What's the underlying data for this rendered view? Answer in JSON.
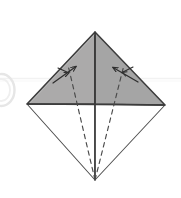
{
  "figure": {
    "type": "diagram",
    "caption": "",
    "canvas": {
      "width": 181,
      "height": 198
    },
    "background_color": "#ffffff"
  },
  "colors": {
    "shaded_fill": "#a8a8a8",
    "shaded_fill_light": "#b0b0b0",
    "outline_stroke": "#3c3c3c",
    "thin_stroke": "#555555",
    "dashed_stroke": "#4a4a4a",
    "arrow_stroke": "#333333",
    "faint_guide": "#f0f0f0",
    "faint_arc": "#e8e8e8",
    "white_fill": "#ffffff"
  },
  "geometry": {
    "top_vertex": {
      "x": 95,
      "y": 32
    },
    "left_vertex": {
      "x": 27,
      "y": 104
    },
    "right_vertex": {
      "x": 165,
      "y": 105
    },
    "bottom_vertex": {
      "x": 95,
      "y": 180
    },
    "center": {
      "x": 95,
      "y": 104
    }
  },
  "shapes": [
    {
      "name": "upper-left-shaded-triangle",
      "kind": "polygon",
      "points": "95,32 27,104 95,104",
      "fill": "#a9a9a9",
      "stroke": "#3c3c3c"
    },
    {
      "name": "upper-right-shaded-triangle",
      "kind": "polygon",
      "points": "95,32 165,105 95,104",
      "fill": "#a3a3a3",
      "stroke": "#3c3c3c"
    },
    {
      "name": "lower-left-white-triangle",
      "kind": "polygon",
      "points": "27,104 95,104 95,180",
      "fill": "#ffffff",
      "stroke": "#4a4a4a"
    },
    {
      "name": "lower-right-white-triangle",
      "kind": "polygon",
      "points": "95,104 165,105 95,180",
      "fill": "#ffffff",
      "stroke": "#4a4a4a"
    }
  ],
  "lines": {
    "vertical_crease": {
      "x1": 95,
      "y1": 32,
      "x2": 95,
      "y2": 180
    },
    "horizontal_crease": {
      "x1": 27,
      "y1": 104,
      "x2": 165,
      "y2": 105
    },
    "faint_guide_line": {
      "x1": 0,
      "y1": 78,
      "x2": 181,
      "y2": 78
    }
  },
  "dashed_fold_lines": [
    {
      "name": "left-dashed-fold",
      "x1": 95,
      "y1": 180,
      "x2": 68,
      "y2": 66,
      "dash": "4,4"
    },
    {
      "name": "right-dashed-fold",
      "x1": 95,
      "y1": 180,
      "x2": 124,
      "y2": 66,
      "dash": "4,4"
    }
  ],
  "arrows": [
    {
      "name": "left-fold-arrow",
      "direction": "up-right",
      "tail": {
        "x": 54,
        "y": 82
      },
      "head": {
        "x": 75,
        "y": 67
      },
      "label": ""
    },
    {
      "name": "right-fold-arrow",
      "direction": "up-left",
      "tail": {
        "x": 137,
        "y": 82
      },
      "head": {
        "x": 114,
        "y": 68
      },
      "label": ""
    }
  ],
  "decorations": [
    {
      "name": "left-edge-faint-arc",
      "kind": "arc",
      "cx": 2,
      "cy": 90,
      "rx": 13,
      "ry": 16
    }
  ]
}
